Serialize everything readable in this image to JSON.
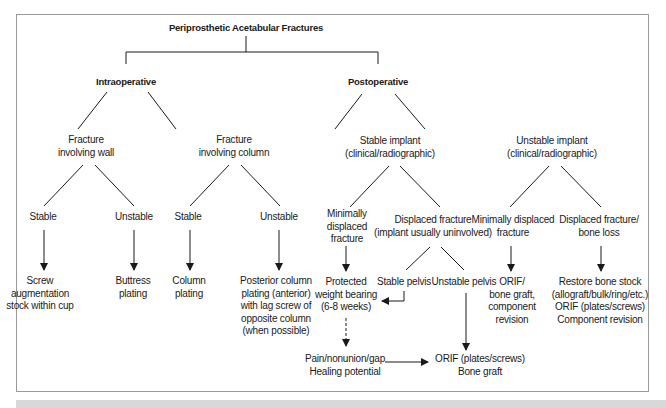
{
  "diagram": {
    "title": "Periprosthetic Acetabular Fractures",
    "branches": {
      "intraoperative": {
        "label": "Intraoperative",
        "wall": {
          "label": "Fracture\ninvolving wall",
          "stable": {
            "label": "Stable",
            "treatment": "Screw\naugmentation\nstock within cup"
          },
          "unstable": {
            "label": "Unstable",
            "treatment": "Buttress\nplating"
          }
        },
        "column": {
          "label": "Fracture\ninvolving column",
          "stable": {
            "label": "Stable",
            "treatment": "Column\nplating"
          },
          "unstable": {
            "label": "Unstable",
            "treatment": "Posterior column\nplating (anterior)\nwith lag screw of\nopposite column\n(when possible)"
          }
        }
      },
      "postoperative": {
        "label": "Postoperative",
        "stable_implant": {
          "label": "Stable implant\n(clinical/radiographic)",
          "minimally_displaced": {
            "label": "Minimally\ndisplaced\nfracture",
            "treatment": "Protected\nweight bearing\n(6-8 weeks)",
            "followup": "Pain/nonunion/gap\nHealing potential"
          },
          "displaced": {
            "label": "Displaced fracture\n(implant usually uninvolved)",
            "stable_pelvis": "Stable pelvis",
            "unstable_pelvis": "Unstable pelvis",
            "treatment": "ORIF (plates/screws)\nBone graft"
          }
        },
        "unstable_implant": {
          "label": "Unstable implant\n(clinical/radiographic)",
          "minimally_displaced": {
            "label": "Minimally displaced\nfracture",
            "treatment": "ORIF/\nbone graft,\ncomponent\nrevision"
          },
          "displaced": {
            "label": "Displaced fracture/\nbone loss",
            "treatment": "Restore bone stock\n(allograft/bulk/ring/etc.)\nORIF (plates/screws)\nComponent revision"
          }
        }
      }
    },
    "colors": {
      "line": "#1a1a1a",
      "frame": "#9a9a9a",
      "bottom_bar": "#d8d8d8"
    }
  }
}
